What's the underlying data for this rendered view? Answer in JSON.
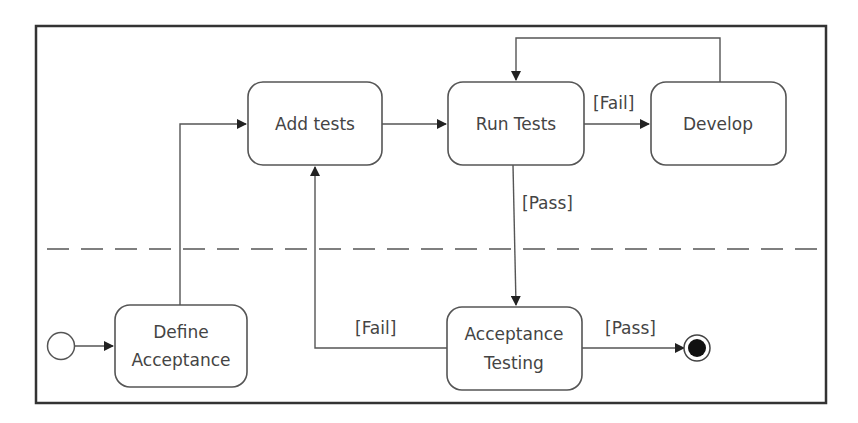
{
  "diagram": {
    "type": "UML activity / state diagram",
    "states": {
      "add_tests": "Add tests",
      "run_tests": "Run Tests",
      "develop": "Develop",
      "define_acceptance_line1": "Define",
      "define_acceptance_line2": "Acceptance",
      "acceptance_testing_line1": "Acceptance",
      "acceptance_testing_line2": "Testing"
    },
    "guards": {
      "run_to_develop": "[Fail]",
      "run_to_acceptance": "[Pass]",
      "acceptance_to_add": "[Fail]",
      "acceptance_to_final": "[Pass]"
    },
    "transitions": [
      {
        "from": "initial",
        "to": "Define Acceptance",
        "guard": ""
      },
      {
        "from": "Define Acceptance",
        "to": "Add tests",
        "guard": ""
      },
      {
        "from": "Add tests",
        "to": "Run Tests",
        "guard": ""
      },
      {
        "from": "Run Tests",
        "to": "Develop",
        "guard": "[Fail]"
      },
      {
        "from": "Develop",
        "to": "Run Tests",
        "guard": ""
      },
      {
        "from": "Run Tests",
        "to": "Acceptance Testing",
        "guard": "[Pass]"
      },
      {
        "from": "Acceptance Testing",
        "to": "Add tests",
        "guard": "[Fail]"
      },
      {
        "from": "Acceptance Testing",
        "to": "final",
        "guard": "[Pass]"
      }
    ],
    "colors": {
      "stroke": "#555555",
      "frame": "#333333",
      "text": "#444444"
    }
  }
}
